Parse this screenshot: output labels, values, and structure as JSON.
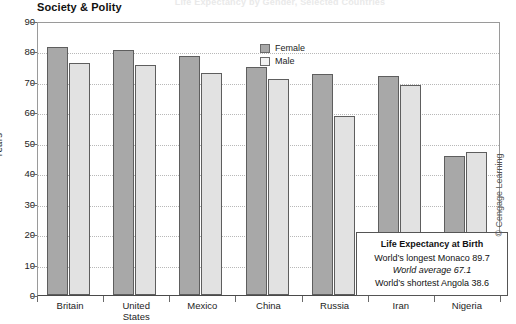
{
  "figure": {
    "top_caption": "Life Expectancy by Gender, Selected Countries",
    "section_heading": "Society & Polity",
    "credit": "© Cengage Learning"
  },
  "legend": {
    "items": [
      {
        "label": "Female",
        "color": "#a8a8a8"
      },
      {
        "label": "Male",
        "color": "#f2f2f2"
      }
    ]
  },
  "callout": {
    "title": "Life Expectancy at Birth",
    "longest": "World’s longest Monaco 89.7",
    "average": "World average 67.1",
    "shortest": "World’s shortest Angola 38.6"
  },
  "chart_data": {
    "type": "bar",
    "title": "Society & Polity",
    "xlabel": "",
    "ylabel": "Years",
    "ylim": [
      0,
      90
    ],
    "ytick_step": 10,
    "yticks": [
      0,
      10,
      20,
      30,
      40,
      50,
      60,
      70,
      80,
      90
    ],
    "grid": true,
    "legend_position": "top-right",
    "categories": [
      "Britain",
      "United States",
      "Mexico",
      "China",
      "Russia",
      "Iran",
      "Nigeria"
    ],
    "series": [
      {
        "name": "Female",
        "color": "#a8a8a8",
        "values": [
          81.5,
          80.4,
          78.6,
          75.0,
          72.6,
          72.0,
          45.5
        ]
      },
      {
        "name": "Male",
        "color": "#e2e2e2",
        "values": [
          76.3,
          75.4,
          72.9,
          71.0,
          58.8,
          69.1,
          47.1
        ]
      }
    ],
    "annotations": [
      "Life Expectancy at Birth",
      "World’s longest Monaco 89.7",
      "World average 67.1",
      "World’s shortest Angola 38.6"
    ]
  }
}
